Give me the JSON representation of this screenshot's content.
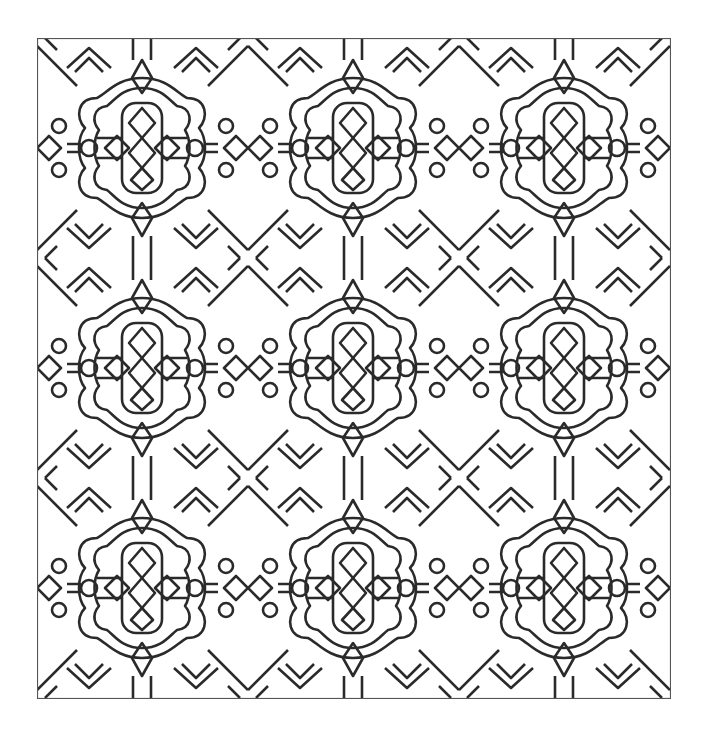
{
  "artwork": {
    "kind": "coloring page pattern",
    "style": "stained-glass ornamental tile",
    "grid": {
      "columns": 3,
      "rows": 3
    },
    "colors": {
      "stroke": "#2a2a2a",
      "fill": "#ffffff",
      "background": "#ffffff"
    }
  }
}
